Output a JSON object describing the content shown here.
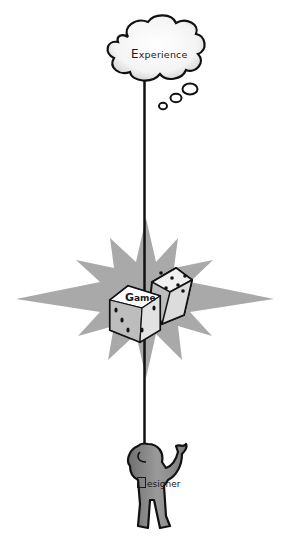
{
  "diagram": {
    "type": "concept-hierarchy",
    "nodes": [
      {
        "id": "experience",
        "label_first": "E",
        "label_rest": "xperience",
        "shape": "thought-cloud",
        "position": "top"
      },
      {
        "id": "game",
        "label_first": "G",
        "label_rest": "ame",
        "shape": "dice-on-starburst",
        "position": "middle"
      },
      {
        "id": "designer",
        "label_first": "",
        "label_rest": "esigner",
        "shape": "person-figure",
        "position": "bottom"
      }
    ],
    "connector": {
      "type": "vertical-line",
      "from": "designer",
      "to": "experience",
      "through": "game"
    },
    "colors": {
      "line": "#111111",
      "starburst": "#a9a9a9",
      "figure": "#8a8a8a",
      "cloud_fill": "#ffffff",
      "dice_fill": "#f2f2f2",
      "dice_side": "#bdbdbd"
    }
  }
}
